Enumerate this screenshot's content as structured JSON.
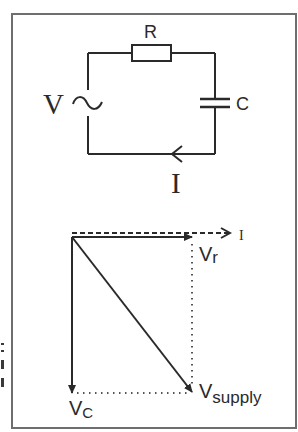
{
  "colors": {
    "background": "#ffffff",
    "frame": "#6e6e6e",
    "ink": "#2a2a2a",
    "dotted": "#555555"
  },
  "circuit": {
    "source_label": "V",
    "source_symbol": "~",
    "resistor_label": "R",
    "capacitor_label": "C",
    "current_label": "I"
  },
  "phasor": {
    "current_label": "I",
    "vr_main": "V",
    "vr_sub": "r",
    "vsupply_main": "V",
    "vsupply_sub": "supply",
    "vc_main": "V",
    "vc_sub": "C"
  }
}
